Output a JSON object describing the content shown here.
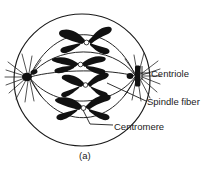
{
  "figure": {
    "caption": "(a)",
    "labels": {
      "centriole": "Centriole",
      "spindle_fiber": "Spindle fiber",
      "centromere": "Centromere"
    },
    "colors": {
      "ink": "#1a1a1a",
      "outline": "#1a1a1a",
      "background": "#ffffff",
      "chromosome_fill": "#111111"
    },
    "structure": {
      "cell_membrane": {
        "cx": 82,
        "cy": 80,
        "rx": 68,
        "ry": 66
      },
      "centrioles": [
        {
          "name": "left-centriole",
          "x": 27,
          "y": 77
        },
        {
          "name": "right-centriole",
          "x": 137,
          "y": 76
        }
      ],
      "chromosome_count": 4,
      "chromosomes": [
        {
          "name": "chromosome-1",
          "x": 86,
          "y": 40
        },
        {
          "name": "chromosome-2",
          "x": 80,
          "y": 64
        },
        {
          "name": "chromosome-3",
          "x": 84,
          "y": 84
        },
        {
          "name": "chromosome-4",
          "x": 82,
          "y": 106
        }
      ],
      "spindle_fiber_count": 5,
      "aster_ray_count_per_pole": 12
    }
  }
}
